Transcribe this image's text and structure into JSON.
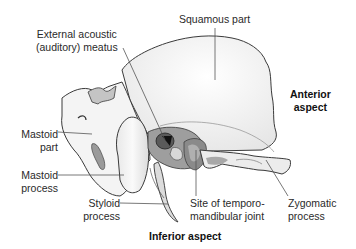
{
  "diagram": {
    "labels": {
      "external_meatus": [
        "External acoustic",
        "(auditory) meatus"
      ],
      "squamous": "Squamous part",
      "anterior": [
        "Anterior",
        "aspect"
      ],
      "mastoid_part": [
        "Mastoid",
        "part"
      ],
      "mastoid_process": [
        "Mastoid",
        "process"
      ],
      "styloid": [
        "Styloid",
        "process"
      ],
      "tmj": [
        "Site of temporo-",
        "mandibular joint"
      ],
      "zygomatic": [
        "Zygomatic",
        "process"
      ],
      "inferior": "Inferior aspect"
    },
    "colors": {
      "bone_fill": "#f2f2f2",
      "bone_outline": "#3a3a3a",
      "shadow": "#b8b8b8",
      "dark": "#1a1a1a",
      "leader": "#555555"
    }
  }
}
